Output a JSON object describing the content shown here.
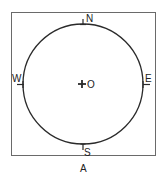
{
  "diagram": {
    "caption": "A",
    "center_label": "O",
    "directions": {
      "north": "N",
      "south": "S",
      "east": "E",
      "west": "W"
    },
    "colors": {
      "stroke": "#2a2a2a",
      "frame": "#6a6a6a",
      "background": "#ffffff"
    }
  }
}
